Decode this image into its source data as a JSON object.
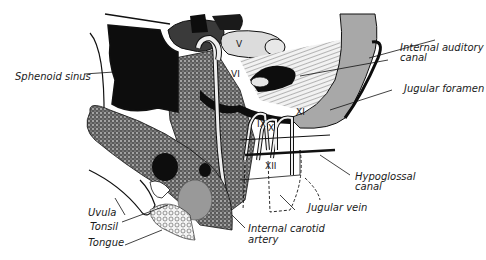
{
  "figure": {
    "kind": "anatomical line drawing",
    "colors": {
      "ink": "#111111",
      "black_fill": "#0d0d0d",
      "gray_fill": "#a8a8a8",
      "light_gray": "#d8d8d8",
      "stipple": "#4a4a4a",
      "background": "#ffffff"
    }
  },
  "labels": {
    "sphenoid_sinus": "Sphenoid sinus",
    "internal_auditory_canal_1": "Internal auditory",
    "internal_auditory_canal_2": "canal",
    "jugular_foramen": "Jugular foramen",
    "hypoglossal_canal_1": "Hypoglossal",
    "hypoglossal_canal_2": "canal",
    "jugular_vein": "Jugular vein",
    "internal_carotid_artery_1": "Internal carotid",
    "internal_carotid_artery_2": "artery",
    "uvula": "Uvula",
    "tonsil": "Tonsil",
    "tongue": "Tongue"
  },
  "cranial_nerve_numerals": {
    "v": "V",
    "vi": "VI",
    "ix": "IX",
    "x": "X",
    "xi": "XI",
    "xii": "XII"
  }
}
